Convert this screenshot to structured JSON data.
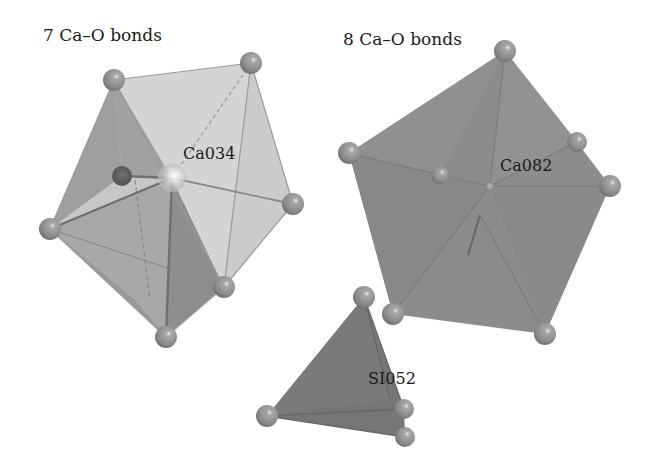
{
  "figure": {
    "left_polyhedron": {
      "heading": "7 Ca–O bonds",
      "center_label": "Ca034",
      "coordination": 7
    },
    "right_polyhedron": {
      "heading": "8 Ca–O bonds",
      "center_label": "Ca082",
      "coordination": 8
    },
    "tetrahedron": {
      "center_label": "SI052",
      "coordination": 4
    }
  },
  "colors": {
    "background": "#ffffff",
    "light_facet": "#d2d2d2",
    "mid_facet": "#a4a4a4",
    "dark_facet": "#8c8c8c",
    "tetra_facet": "#777777",
    "atom": "#8e8e8e",
    "bond": "#6a6a6a"
  }
}
